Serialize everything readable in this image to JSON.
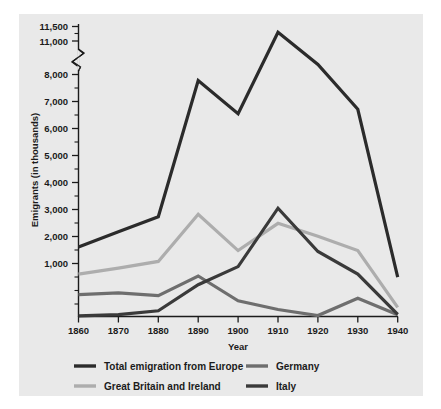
{
  "chart_data": {
    "type": "line",
    "title": "",
    "xlabel": "Year",
    "ylabel": "Emigrants (in thousands)",
    "x": [
      1860,
      1870,
      1880,
      1890,
      1900,
      1910,
      1920,
      1930,
      1940
    ],
    "xtick_labels": [
      "1860",
      "1870",
      "1880",
      "1890",
      "1900",
      "1910",
      "1920",
      "1930",
      "1940"
    ],
    "ytick_labels": [
      "11,500",
      "11,000",
      "8,000",
      "7,000",
      "6,000",
      "5,000",
      "4,000",
      "3,000",
      "2,000",
      "1,000"
    ],
    "ytick_values": [
      11500,
      11000,
      8000,
      7000,
      6000,
      5000,
      4000,
      3000,
      2000,
      1000
    ],
    "yminor_values": [
      10500,
      7500,
      6500,
      5500,
      4500,
      3500,
      2500,
      1500,
      500
    ],
    "axis_break": {
      "present": true,
      "between": [
        8000,
        11000
      ],
      "label": "axis-break-zigzag"
    },
    "ylim": [
      0,
      11500
    ],
    "xlim": [
      1860,
      1940
    ],
    "grid": false,
    "legend_position": "below-plot",
    "series": [
      {
        "name": "Total emigration from Europe",
        "color": "#2b2b2b",
        "values": [
          2300,
          2800,
          3300,
          7800,
          6700,
          11300,
          8900,
          6850,
          1300
        ]
      },
      {
        "name": "Great Britain and Ireland",
        "color": "#adadad",
        "values": [
          1400,
          1600,
          1820,
          3380,
          2180,
          3080,
          2650,
          2180,
          300
        ]
      },
      {
        "name": "Germany",
        "color": "#6e6e6e",
        "values": [
          720,
          780,
          690,
          1340,
          520,
          230,
          30,
          600,
          60
        ]
      },
      {
        "name": "Italy",
        "color": "#3a3a3a",
        "values": [
          20,
          60,
          190,
          1050,
          1650,
          3580,
          2150,
          1400,
          70
        ]
      }
    ]
  },
  "legend": {
    "entries": [
      {
        "label": "Total emigration from Europe",
        "color": "#2b2b2b",
        "swatch": "legend-swatch-total"
      },
      {
        "label": "Germany",
        "color": "#6e6e6e",
        "swatch": "legend-swatch-germany"
      },
      {
        "label": "Great Britain and Ireland",
        "color": "#adadad",
        "swatch": "legend-swatch-gbi"
      },
      {
        "label": "Italy",
        "color": "#3a3a3a",
        "swatch": "legend-swatch-italy"
      }
    ]
  },
  "colors": {
    "panel_background": "#e9e9e9",
    "page_background": "#ffffff",
    "axis": "#1b1b1b",
    "text": "#1b1b1b"
  }
}
